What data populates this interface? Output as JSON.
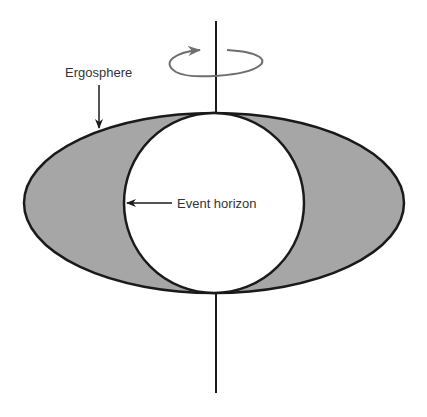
{
  "diagram": {
    "labels": {
      "ergosphere": "Ergosphere",
      "event_horizon": "Event horizon"
    },
    "icons": {
      "rotation": "rotation-arrow-icon"
    },
    "colors": {
      "ergosphere_fill": "#a6a6a6",
      "outline": "#1a1a1a",
      "rotation_arrow": "#6e6e6e",
      "horizon_fill": "#ffffff"
    }
  }
}
